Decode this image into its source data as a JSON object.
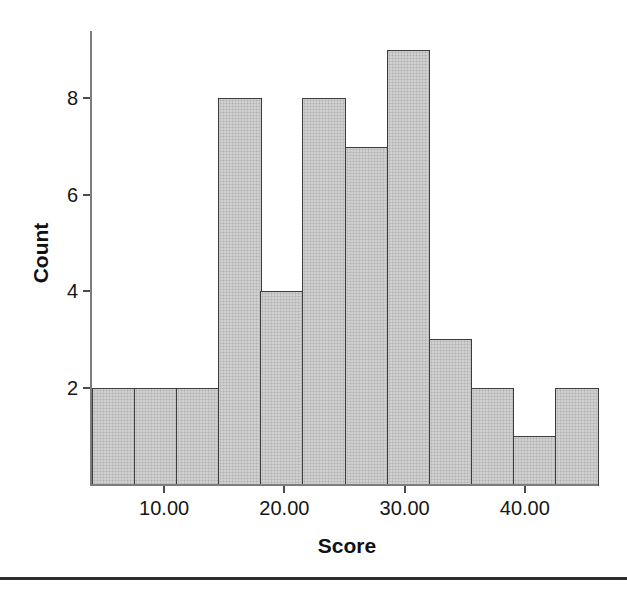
{
  "figure": {
    "background": "#ffffff",
    "divider_color": "#2d2d2d"
  },
  "chart_data": {
    "type": "bar",
    "subtype": "histogram",
    "title": "",
    "xlabel": "Score",
    "ylabel": "Count",
    "x_tick_labels": [
      "10.00",
      "20.00",
      "30.00",
      "40.00"
    ],
    "x_tick_values": [
      10,
      20,
      30,
      40
    ],
    "y_tick_labels": [
      "2",
      "4",
      "6",
      "8"
    ],
    "y_tick_values": [
      2,
      4,
      6,
      8
    ],
    "xlim": [
      4,
      46
    ],
    "ylim": [
      0,
      9.4
    ],
    "bin_edges": [
      4,
      7.5,
      11,
      14.5,
      18,
      21.5,
      25,
      28.5,
      32,
      35.5,
      39,
      42.5,
      46
    ],
    "counts": [
      2,
      2,
      2,
      8,
      4,
      8,
      7,
      9,
      3,
      2,
      1,
      2
    ],
    "grid": false,
    "legend": false,
    "colors": {
      "bar_fill": "#d0d0d0",
      "bar_dot": "#b3b3b3",
      "bar_border": "#3c3c3c",
      "axis_line": "#7d7d7d",
      "tick_mark": "#4d4d4d",
      "text": "#161616"
    }
  }
}
